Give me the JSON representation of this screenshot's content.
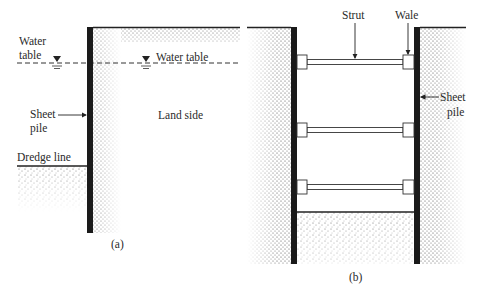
{
  "figure_a": {
    "caption": "(a)",
    "labels": {
      "water_table_left_line1": "Water",
      "water_table_left_line2": "table",
      "water_table_right": "Water table",
      "sheet_pile_line1": "Sheet",
      "sheet_pile_line2": "pile",
      "land_side": "Land side",
      "dredge_line": "Dredge line"
    }
  },
  "figure_b": {
    "caption": "(b)",
    "labels": {
      "strut": "Strut",
      "wale": "Wale",
      "sheet_pile_line1": "Sheet",
      "sheet_pile_line2": "pile"
    },
    "strut_count": 3
  },
  "colors": {
    "pile": "#1a1a1a",
    "soil_dot": "#555555",
    "line": "#333333",
    "text": "#2a2a2a"
  }
}
